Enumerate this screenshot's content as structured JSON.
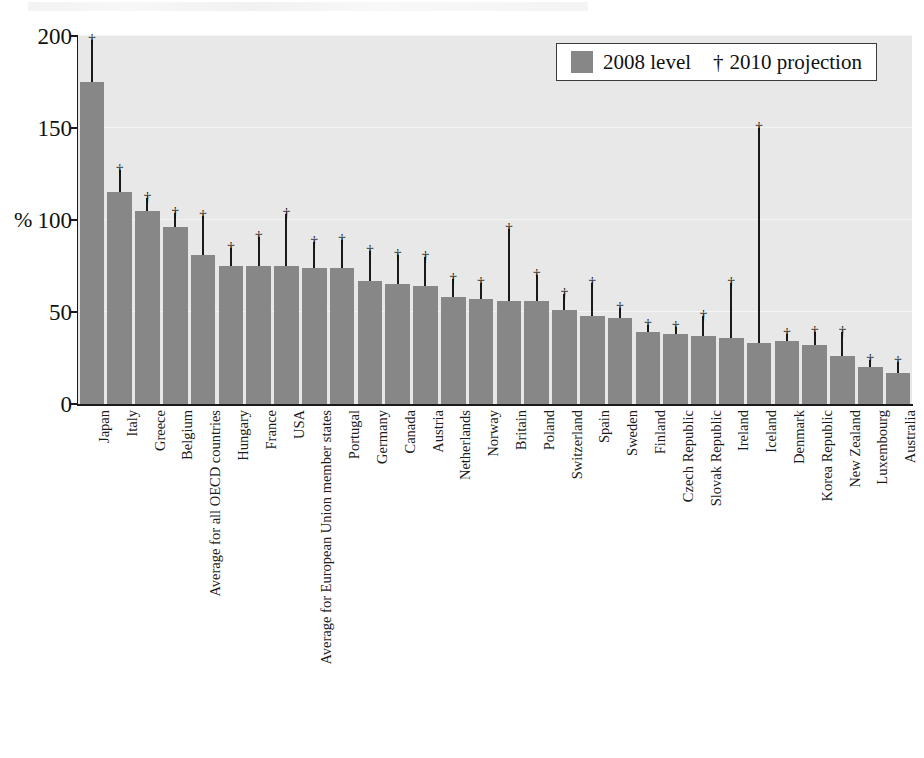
{
  "chart_data": {
    "type": "bar",
    "title": "",
    "subtitle": "",
    "xlabel": "",
    "ylabel": "%",
    "ylim": [
      0,
      200
    ],
    "yticks": [
      0,
      50,
      100,
      150,
      200
    ],
    "grid": true,
    "legend_position": "top-right",
    "legend": [
      {
        "label": "2008 level",
        "marker": "filled-square",
        "color": "#878787"
      },
      {
        "label": "2010 projection",
        "marker": "dagger",
        "symbol": "†",
        "color": "#111111"
      }
    ],
    "categories": [
      "Japan",
      "Italy",
      "Greece",
      "Belgium",
      "Average for all OECD countries",
      "Hungary",
      "France",
      "USA",
      "Average for European Union member states",
      "Portugal",
      "Germany",
      "Canada",
      "Austria",
      "Netherlands",
      "Norway",
      "Britain",
      "Poland",
      "Switzerland",
      "Spain",
      "Sweden",
      "Finland",
      "Czech Republic",
      "Slovak Republic",
      "Ireland",
      "Iceland",
      "Denmark",
      "Korea Republic",
      "New Zealand",
      "Luxembourg",
      "Australia"
    ],
    "series": [
      {
        "name": "2008 level",
        "color": "#878787",
        "values": [
          175,
          115,
          105,
          96,
          81,
          75,
          75,
          75,
          74,
          74,
          67,
          65,
          64,
          58,
          57,
          56,
          56,
          51,
          48,
          47,
          39,
          38,
          37,
          36,
          33,
          34,
          32,
          26,
          20,
          17
        ]
      },
      {
        "name": "2010 projection",
        "color": "#111111",
        "marker": "†",
        "values": [
          198,
          127,
          112,
          104,
          102,
          85,
          91,
          103,
          88,
          89,
          83,
          81,
          80,
          68,
          66,
          95,
          70,
          60,
          66,
          52,
          43,
          42,
          48,
          66,
          150,
          38,
          39,
          39,
          24,
          23
        ]
      }
    ]
  }
}
